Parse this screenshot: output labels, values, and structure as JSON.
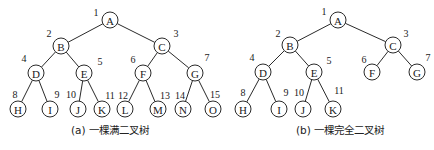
{
  "diagrams": [
    {
      "id": "full",
      "caption": "(a) 一棵满二叉树",
      "caption_pos": [
        110,
        130
      ],
      "radius": 8,
      "nodes": [
        {
          "label": "A",
          "num": "1",
          "x": 110,
          "y": 20,
          "nx": 96,
          "ny": 12
        },
        {
          "label": "B",
          "num": "2",
          "x": 61,
          "y": 46,
          "nx": 49,
          "ny": 33
        },
        {
          "label": "C",
          "num": "3",
          "x": 162,
          "y": 46,
          "nx": 176,
          "ny": 33
        },
        {
          "label": "D",
          "num": "4",
          "x": 36,
          "y": 73,
          "nx": 24,
          "ny": 58
        },
        {
          "label": "E",
          "num": "5",
          "x": 84,
          "y": 73,
          "nx": 100,
          "ny": 61
        },
        {
          "label": "F",
          "num": "6",
          "x": 143,
          "y": 73,
          "nx": 133,
          "ny": 59
        },
        {
          "label": "G",
          "num": "7",
          "x": 195,
          "y": 73,
          "nx": 207,
          "ny": 57
        },
        {
          "label": "H",
          "num": "8",
          "x": 18,
          "y": 109,
          "nx": 15,
          "ny": 94
        },
        {
          "label": "I",
          "num": "9",
          "x": 50,
          "y": 109,
          "nx": 57,
          "ny": 94
        },
        {
          "label": "J",
          "num": "10",
          "x": 78,
          "y": 109,
          "nx": 71,
          "ny": 94
        },
        {
          "label": "K",
          "num": "11",
          "x": 102,
          "y": 109,
          "nx": 110,
          "ny": 95
        },
        {
          "label": "L",
          "num": "12",
          "x": 125,
          "y": 109,
          "nx": 123,
          "ny": 95
        },
        {
          "label": "M",
          "num": "13",
          "x": 158,
          "y": 109,
          "nx": 165,
          "ny": 95
        },
        {
          "label": "N",
          "num": "14",
          "x": 183,
          "y": 109,
          "nx": 180,
          "ny": 95
        },
        {
          "label": "O",
          "num": "15",
          "x": 213,
          "y": 109,
          "nx": 215,
          "ny": 94
        }
      ],
      "edges": [
        [
          0,
          1
        ],
        [
          0,
          2
        ],
        [
          1,
          3
        ],
        [
          1,
          4
        ],
        [
          2,
          5
        ],
        [
          2,
          6
        ],
        [
          3,
          7
        ],
        [
          3,
          8
        ],
        [
          4,
          9
        ],
        [
          4,
          10
        ],
        [
          5,
          11
        ],
        [
          5,
          12
        ],
        [
          6,
          13
        ],
        [
          6,
          14
        ]
      ]
    },
    {
      "id": "complete",
      "caption": "(b) 一棵完全二叉树",
      "caption_pos": [
        340,
        130
      ],
      "radius": 8,
      "nodes": [
        {
          "label": "A",
          "num": "1",
          "x": 338,
          "y": 20,
          "nx": 324,
          "ny": 11
        },
        {
          "label": "B",
          "num": "2",
          "x": 290,
          "y": 45,
          "nx": 278,
          "ny": 33
        },
        {
          "label": "C",
          "num": "3",
          "x": 393,
          "y": 45,
          "nx": 406,
          "ny": 33
        },
        {
          "label": "D",
          "num": "4",
          "x": 263,
          "y": 72,
          "nx": 252,
          "ny": 57
        },
        {
          "label": "E",
          "num": "5",
          "x": 314,
          "y": 72,
          "nx": 329,
          "ny": 60
        },
        {
          "label": "F",
          "num": "6",
          "x": 372,
          "y": 72,
          "nx": 364,
          "ny": 59
        },
        {
          "label": "G",
          "num": "7",
          "x": 417,
          "y": 72,
          "nx": 428,
          "ny": 57
        },
        {
          "label": "H",
          "num": "8",
          "x": 243,
          "y": 109,
          "nx": 243,
          "ny": 92
        },
        {
          "label": "I",
          "num": "9",
          "x": 279,
          "y": 109,
          "nx": 286,
          "ny": 92
        },
        {
          "label": "J",
          "num": "10",
          "x": 303,
          "y": 109,
          "nx": 299,
          "ny": 92
        },
        {
          "label": "K",
          "num": "11",
          "x": 333,
          "y": 109,
          "nx": 339,
          "ny": 90
        }
      ],
      "edges": [
        [
          0,
          1
        ],
        [
          0,
          2
        ],
        [
          1,
          3
        ],
        [
          1,
          4
        ],
        [
          2,
          5
        ],
        [
          2,
          6
        ],
        [
          3,
          7
        ],
        [
          3,
          8
        ],
        [
          4,
          9
        ],
        [
          4,
          10
        ]
      ]
    }
  ]
}
